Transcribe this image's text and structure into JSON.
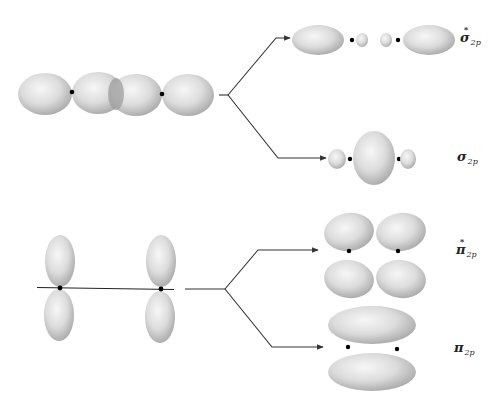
{
  "diagram": {
    "sigma_combination": {
      "description": "Two 2p orbitals overlapping end-to-end along the internuclear axis",
      "nuclei": 2
    },
    "pi_combination": {
      "description": "Two 2p orbitals side-by-side, parallel, perpendicular to internuclear axis",
      "nuclei": 2
    },
    "labels": {
      "sigma_star": {
        "symbol": "σ",
        "superscript": "*",
        "subscript": "2p"
      },
      "sigma": {
        "symbol": "σ",
        "subscript": "2p"
      },
      "pi_star": {
        "symbol": "π",
        "superscript": "*",
        "subscript": "2p"
      },
      "pi": {
        "symbol": "π",
        "subscript": "2p"
      }
    },
    "colors": {
      "lobe_light": "#f4f4f4",
      "lobe_mid": "#d6d6d6",
      "lobe_dark": "#a8a8a8",
      "overlap": "#9e9e9e",
      "line": "#333333",
      "nucleus": "#000000"
    }
  }
}
